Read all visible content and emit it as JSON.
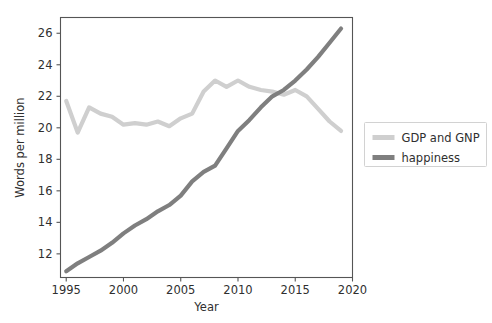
{
  "chart_data": {
    "type": "line",
    "title": "",
    "xlabel": "Year",
    "ylabel": "Words per million",
    "xlim": [
      1994.5,
      2020.0
    ],
    "ylim": [
      10.5,
      27.0
    ],
    "xticks": [
      1995,
      2000,
      2005,
      2010,
      2015,
      2020
    ],
    "xtick_labels": [
      "1995",
      "2000",
      "2005",
      "2010",
      "2015",
      "2020"
    ],
    "yticks": [
      12,
      14,
      16,
      18,
      20,
      22,
      24,
      26
    ],
    "ytick_labels": [
      "12",
      "14",
      "16",
      "18",
      "20",
      "22",
      "24",
      "26"
    ],
    "grid": false,
    "legend_position": "right-outside",
    "x": [
      1995,
      1996,
      1997,
      1998,
      1999,
      2000,
      2001,
      2002,
      2003,
      2004,
      2005,
      2006,
      2007,
      2008,
      2009,
      2010,
      2011,
      2012,
      2013,
      2014,
      2015,
      2016,
      2017,
      2018,
      2019
    ],
    "series": [
      {
        "name": "GDP and GNP",
        "color": "#cfcfcf",
        "linewidth": 4.2,
        "values": [
          21.7,
          19.7,
          21.3,
          20.9,
          20.7,
          20.2,
          20.3,
          20.2,
          20.4,
          20.1,
          20.6,
          20.9,
          22.3,
          23.0,
          22.6,
          23.0,
          22.6,
          22.4,
          22.3,
          22.1,
          22.4,
          22.0,
          21.2,
          20.4,
          19.8
        ]
      },
      {
        "name": "happiness",
        "color": "#7f7f7f",
        "linewidth": 4.2,
        "values": [
          10.9,
          11.4,
          11.8,
          12.2,
          12.7,
          13.3,
          13.8,
          14.2,
          14.7,
          15.1,
          15.7,
          16.6,
          17.2,
          17.6,
          18.7,
          19.8,
          20.5,
          21.3,
          22.0,
          22.4,
          23.0,
          23.7,
          24.5,
          25.4,
          26.3
        ]
      }
    ]
  },
  "legend": {
    "entries": [
      {
        "label": "GDP and GNP",
        "color": "#cfcfcf"
      },
      {
        "label": "happiness",
        "color": "#7f7f7f"
      }
    ]
  },
  "axes": {
    "x_axis_title": "Year",
    "y_axis_title": "Words per million"
  }
}
